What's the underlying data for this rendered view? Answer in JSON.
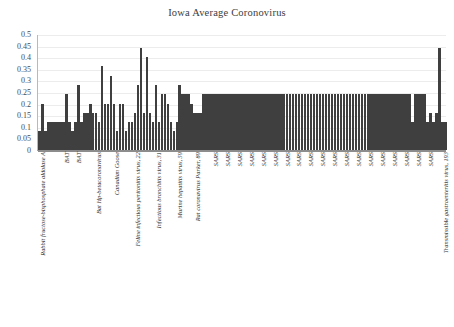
{
  "chart": {
    "title": "Iowa Average Coronovirus"
  },
  "chart_data": {
    "type": "bar",
    "title": "Iowa Average Coronovirus",
    "xlabel": "",
    "ylabel": "",
    "ylim": [
      0,
      0.5
    ],
    "grid": true,
    "legend": false,
    "y_ticks": [
      "0.5",
      "0.45",
      "0.4",
      "0.35",
      "0.3",
      "0.25",
      "0.2",
      "0.15",
      "0.1",
      "0.05",
      "0"
    ],
    "y_tick_values": [
      0.5,
      0.45,
      0.4,
      0.35,
      0.3,
      0.25,
      0.2,
      0.15,
      0.1,
      0.05,
      0
    ],
    "bar_color": "#3f3f3f",
    "categories": [
      "Rabbit fructose-bisphosphate aldolase A",
      "",
      "",
      "",
      "",
      "",
      "",
      "",
      "BAT",
      "",
      "",
      "",
      "BAT",
      "",
      "",
      "",
      "",
      "",
      "",
      "Bat Hp-betacoronavirus",
      "",
      "",
      "",
      "",
      "",
      "Canadian Goose",
      "",
      "",
      "",
      "",
      "",
      "",
      "Feline infectious peritonitis virus, 22",
      "",
      "",
      "",
      "",
      "",
      "",
      "Infectious bronchitis virus, 31",
      "",
      "",
      "",
      "",
      "",
      "",
      "Murine hepatitis virus, 59",
      "",
      "",
      "",
      "",
      "",
      "Rat coronavirus Parker, 89",
      "",
      "",
      "",
      "",
      "",
      "SARS",
      "",
      "",
      "",
      "SARS",
      "",
      "",
      "",
      "SARS",
      "",
      "",
      "",
      "SARS",
      "",
      "",
      "",
      "SARS",
      "",
      "",
      "",
      "SARS",
      "",
      "",
      "",
      "SARS",
      "",
      "",
      "",
      "SARS",
      "",
      "",
      "",
      "SARS",
      "",
      "",
      "",
      "SARS",
      "",
      "",
      "",
      "SARS",
      "",
      "",
      "",
      "SARS",
      "",
      "",
      "",
      "SARS",
      "",
      "",
      "",
      "SARS",
      "",
      "",
      "",
      "SARS",
      "",
      "",
      "",
      "SARS",
      "",
      "",
      "",
      "SARS",
      "",
      "",
      "",
      "SARS",
      "",
      "",
      "",
      "SARS",
      "",
      "",
      "",
      "Transmissible gastroenteritis virus, 193",
      "",
      ""
    ],
    "visible_tick_labels": [
      {
        "index": 0,
        "label": "Rabbit fructose-bisphosphate aldolase A"
      },
      {
        "index": 8,
        "label": "BAT"
      },
      {
        "index": 12,
        "label": "BAT"
      },
      {
        "index": 19,
        "label": "Bat Hp-betacoronavirus"
      },
      {
        "index": 25,
        "label": "Canadian Goose"
      },
      {
        "index": 32,
        "label": "Feline infectious peritonitis virus, 22"
      },
      {
        "index": 39,
        "label": "Infectious bronchitis virus, 31"
      },
      {
        "index": 46,
        "label": "Murine hepatitis virus, 59"
      },
      {
        "index": 52,
        "label": "Rat coronavirus Parker, 89"
      },
      {
        "index": 58,
        "label": "SARS"
      },
      {
        "index": 62,
        "label": "SARS"
      },
      {
        "index": 66,
        "label": "SARS"
      },
      {
        "index": 70,
        "label": "SARS"
      },
      {
        "index": 74,
        "label": "SARS"
      },
      {
        "index": 78,
        "label": "SARS"
      },
      {
        "index": 82,
        "label": "SARS"
      },
      {
        "index": 86,
        "label": "SARS"
      },
      {
        "index": 90,
        "label": "SARS"
      },
      {
        "index": 94,
        "label": "SARS"
      },
      {
        "index": 98,
        "label": "SARS"
      },
      {
        "index": 102,
        "label": "SARS"
      },
      {
        "index": 106,
        "label": "SARS"
      },
      {
        "index": 110,
        "label": "SARS"
      },
      {
        "index": 114,
        "label": "SARS"
      },
      {
        "index": 118,
        "label": "SARS"
      },
      {
        "index": 122,
        "label": "SARS"
      },
      {
        "index": 126,
        "label": "SARS"
      },
      {
        "index": 130,
        "label": "SARS"
      },
      {
        "index": 135,
        "label": "Transmissible gastroenteritis virus, 193"
      }
    ],
    "values": [
      0.08,
      0.2,
      0.08,
      0.12,
      0.12,
      0.12,
      0.12,
      0.12,
      0.12,
      0.24,
      0.12,
      0.08,
      0.12,
      0.28,
      0.12,
      0.16,
      0.16,
      0.2,
      0.16,
      0.16,
      0.12,
      0.36,
      0.2,
      0.2,
      0.32,
      0.2,
      0.08,
      0.2,
      0.2,
      0.08,
      0.12,
      0.12,
      0.16,
      0.28,
      0.44,
      0.16,
      0.4,
      0.16,
      0.12,
      0.28,
      0.12,
      0.24,
      0.24,
      0.2,
      0.12,
      0.08,
      0.12,
      0.28,
      0.24,
      0.24,
      0.24,
      0.2,
      0.16,
      0.16,
      0.16,
      0.24,
      0.24,
      0.24,
      0.24,
      0.24,
      0.24,
      0.24,
      0.24,
      0.24,
      0.24,
      0.24,
      0.24,
      0.24,
      0.24,
      0.24,
      0.24,
      0.24,
      0.24,
      0.24,
      0.24,
      0.24,
      0.24,
      0.24,
      0.24,
      0.24,
      0.24,
      0.24,
      0.24,
      0.24,
      0.24,
      0.24,
      0.24,
      0.24,
      0.24,
      0.24,
      0.24,
      0.24,
      0.24,
      0.24,
      0.24,
      0.24,
      0.24,
      0.24,
      0.24,
      0.24,
      0.24,
      0.24,
      0.24,
      0.24,
      0.24,
      0.24,
      0.24,
      0.24,
      0.24,
      0.24,
      0.24,
      0.24,
      0.24,
      0.24,
      0.24,
      0.24,
      0.24,
      0.24,
      0.24,
      0.24,
      0.24,
      0.24,
      0.24,
      0.24,
      0.24,
      0.12,
      0.24,
      0.24,
      0.24,
      0.24,
      0.12,
      0.16,
      0.12,
      0.16,
      0.44,
      0.12,
      0.12
    ]
  }
}
